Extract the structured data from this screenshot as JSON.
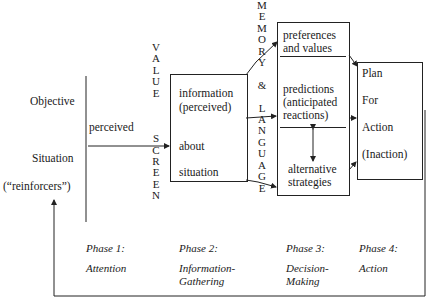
{
  "left": {
    "objective": "Objective",
    "situation": "Situation",
    "reinforcers": "(“reinforcers”)",
    "perceived": "perceived"
  },
  "value_screen": {
    "letters": [
      "V",
      "A",
      "L",
      "U",
      "E",
      "",
      "",
      "",
      "S",
      "C",
      "R",
      "E",
      "E",
      "N"
    ],
    "label": "VALUE SCREEN"
  },
  "memory_language": {
    "letters": [
      "M",
      "E",
      "M",
      "O",
      "R",
      "Y",
      "",
      "&",
      "",
      "L",
      "A",
      "N",
      "G",
      "U",
      "A",
      "G",
      "E"
    ],
    "label": "MEMORY & LANGUAGE"
  },
  "info_box": {
    "line1": "information",
    "line2": "(perceived)",
    "line3": "about",
    "line4": "situation"
  },
  "decision_box": {
    "top_line1": "preferences",
    "top_line2": "and values",
    "mid_line1": "predictions",
    "mid_line2": "(anticipated",
    "mid_line3": "reactions)",
    "bot_line1": "alternative",
    "bot_line2": "strategies"
  },
  "action_box": {
    "line1": "Plan",
    "line2": "For",
    "line3": "Action",
    "line4": "(Inaction)"
  },
  "phases": [
    {
      "title": "Phase 1:",
      "name_line1": "Attention",
      "name_line2": ""
    },
    {
      "title": "Phase 2:",
      "name_line1": "Information-",
      "name_line2": "Gathering"
    },
    {
      "title": "Phase 3:",
      "name_line1": "Decision-",
      "name_line2": "Making"
    },
    {
      "title": "Phase 4:",
      "name_line1": "Action",
      "name_line2": ""
    }
  ]
}
